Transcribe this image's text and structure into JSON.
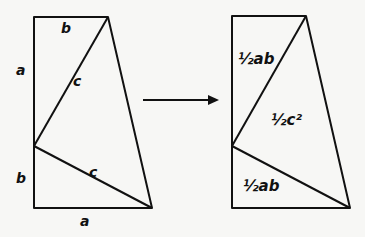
{
  "diagram": {
    "left_figure": {
      "labels": {
        "top_edge": "b",
        "left_upper": "a",
        "left_lower": "b",
        "bottom_edge": "a",
        "upper_hypotenuse": "c",
        "lower_hypotenuse": "c"
      }
    },
    "arrow": {
      "direction": "right"
    },
    "right_figure": {
      "labels": {
        "upper_triangle": "½ab",
        "middle_triangle": "½c²",
        "lower_triangle": "½ab"
      }
    },
    "colors": {
      "stroke": "#111111",
      "background": "#f7f7f5"
    }
  }
}
